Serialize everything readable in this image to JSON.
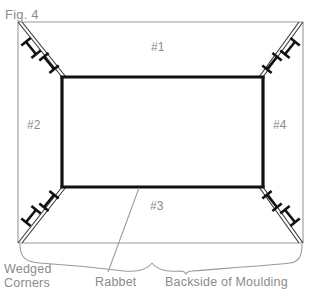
{
  "figure": {
    "title": "Fig. 4",
    "stroke_gray": "#999999",
    "stroke_black": "#111111",
    "text_gray": "#8b8b8b",
    "background": "#ffffff"
  },
  "parts": [
    {
      "id": "part-1",
      "label": "#1",
      "position": "top-rail"
    },
    {
      "id": "part-2",
      "label": "#2",
      "position": "left-stile"
    },
    {
      "id": "part-3",
      "label": "#3",
      "position": "bottom-rail"
    },
    {
      "id": "part-4",
      "label": "#4",
      "position": "right-stile"
    }
  ],
  "annotations": {
    "wedged_corners": "Wedged\nCorners",
    "wedged_corners_line1": "Wedged",
    "wedged_corners_line2": "Corners",
    "rabbet": "Rabbet",
    "backside_of_moulding": "Backside of Moulding"
  },
  "corners": [
    {
      "id": "corner-top-left",
      "wedge_count": 2
    },
    {
      "id": "corner-top-right",
      "wedge_count": 2
    },
    {
      "id": "corner-bottom-left",
      "wedge_count": 2
    },
    {
      "id": "corner-bottom-right",
      "wedge_count": 2
    }
  ]
}
